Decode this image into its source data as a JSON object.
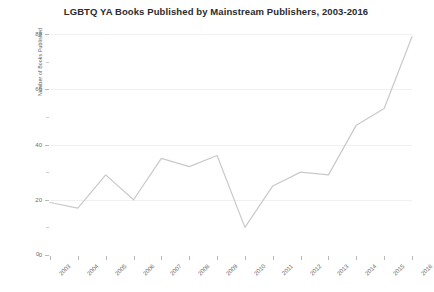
{
  "chart_data": {
    "type": "line",
    "title": "LGBTQ YA Books Published by Mainstream Publishers, 2003-2016",
    "xlabel": "",
    "ylabel": "Number of Books Published",
    "categories": [
      "2003",
      "2004",
      "2005",
      "2006",
      "2007",
      "2008",
      "2009",
      "2010",
      "2011",
      "2012",
      "2013",
      "2014",
      "2015",
      "2016"
    ],
    "values": [
      19,
      17,
      29,
      20,
      35,
      32,
      36,
      10,
      25,
      30,
      29,
      47,
      53,
      79
    ],
    "ylim": [
      0,
      80
    ],
    "y_ticks": [
      0,
      20,
      40,
      60,
      80
    ],
    "y_minor_ticks": [
      10,
      30,
      50,
      70
    ],
    "grid": true,
    "legend": "none",
    "line_color": "#c9c9c9",
    "axis_color": "#b9b9b9",
    "grid_color": "#f0f0f0",
    "text_color": "#6b6b6b",
    "background": "#ffffff"
  }
}
